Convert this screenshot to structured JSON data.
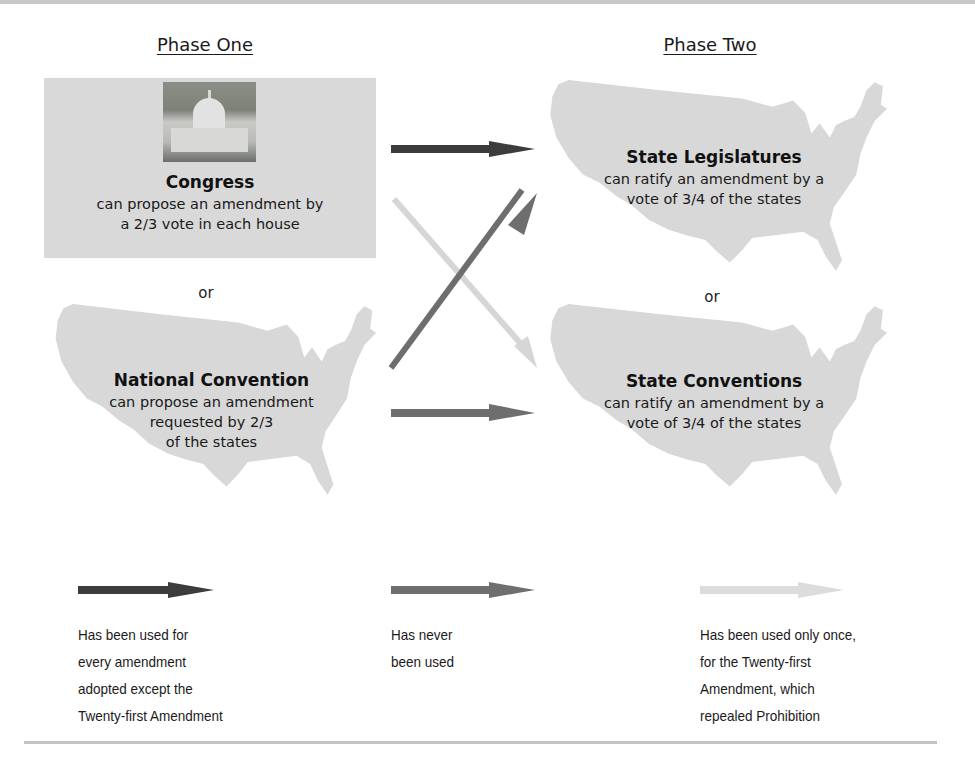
{
  "phases": {
    "one_title": "Phase One",
    "two_title": "Phase Two"
  },
  "proposal": {
    "congress": {
      "title": "Congress",
      "desc_line1": "can propose an amendment by",
      "desc_line2": "a 2/3 vote in each house",
      "image": "capitol-building-photo"
    },
    "or_label": "or",
    "convention": {
      "title": "National Convention",
      "desc_line1": "can propose an amendment",
      "desc_line2": "requested by 2/3",
      "desc_line3": "of the states"
    }
  },
  "ratification": {
    "legislatures": {
      "title": "State Legislatures",
      "desc_line1": "can ratify an amendment by a",
      "desc_line2": "vote of 3/4 of the states"
    },
    "or_label": "or",
    "conventions": {
      "title": "State Conventions",
      "desc_line1": "can ratify an amendment by a",
      "desc_line2": "vote of 3/4 of the states"
    }
  },
  "paths": [
    {
      "from": "Congress",
      "to": "State Legislatures",
      "style": "dark"
    },
    {
      "from": "Congress",
      "to": "State Conventions",
      "style": "light"
    },
    {
      "from": "National Convention",
      "to": "State Legislatures",
      "style": "medium"
    },
    {
      "from": "National Convention",
      "to": "State Conventions",
      "style": "medium"
    }
  ],
  "colors": {
    "dark": "#3c3c3c",
    "medium": "#6e6e6e",
    "light": "#d6d6d6",
    "map_fill": "#d8d8d8",
    "box_fill": "#d9d9d9",
    "rule": "#c6c6c6"
  },
  "legend": [
    {
      "style": "dark",
      "line1": "Has been used for",
      "line2": "every amendment",
      "line3": "adopted except the",
      "line4": "Twenty-first Amendment"
    },
    {
      "style": "medium",
      "line1": "Has never",
      "line2": "been used"
    },
    {
      "style": "light",
      "line1": "Has been used only once,",
      "line2": "for the Twenty-first",
      "line3": "Amendment, which",
      "line4": "repealed Prohibition"
    }
  ]
}
